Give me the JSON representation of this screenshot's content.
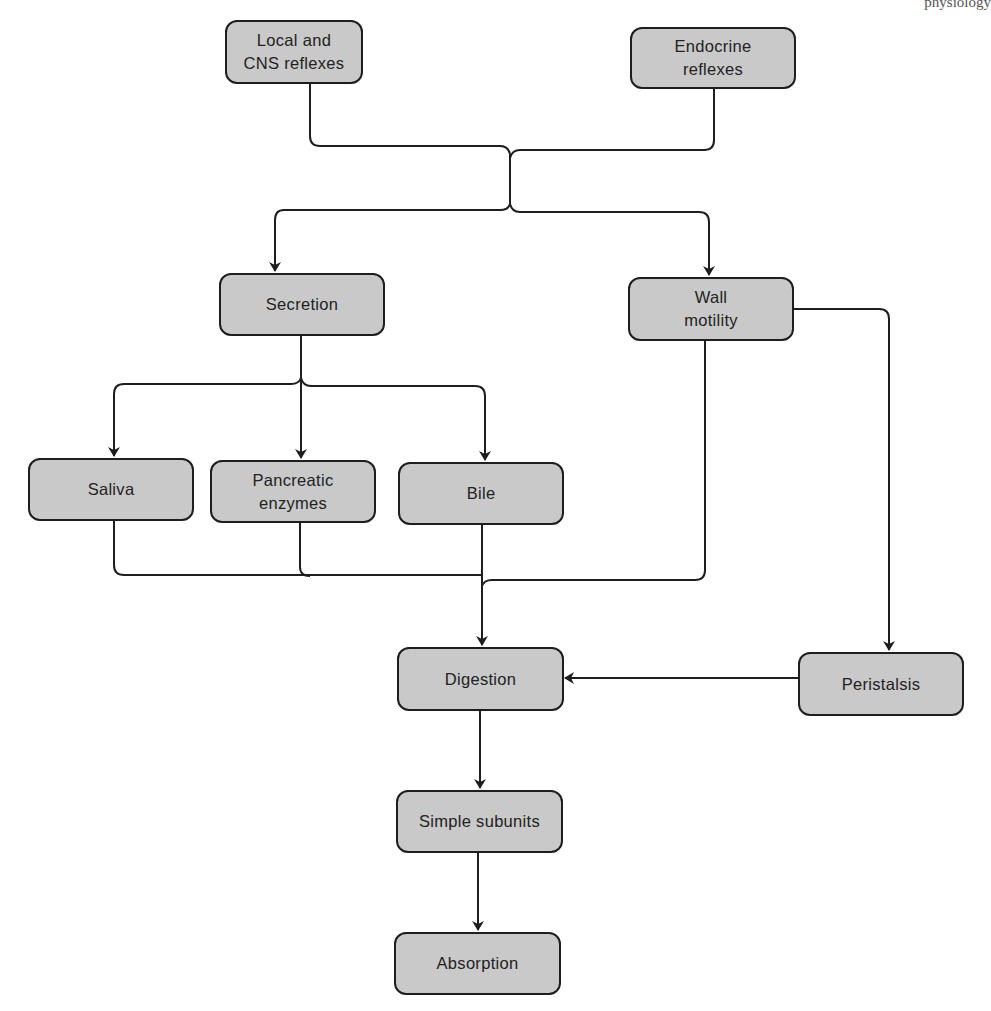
{
  "header_fragment": "physiology",
  "nodes": {
    "local": {
      "label": "Local and\nCNS reflexes"
    },
    "endocrine": {
      "label": "Endocrine\nreflexes"
    },
    "secretion": {
      "label": "Secretion"
    },
    "wall": {
      "label": "Wall\nmotility"
    },
    "saliva": {
      "label": "Saliva"
    },
    "pancreatic": {
      "label": "Pancreatic\nenzymes"
    },
    "bile": {
      "label": "Bile"
    },
    "digestion": {
      "label": "Digestion"
    },
    "peristalsis": {
      "label": "Peristalsis"
    },
    "subunits": {
      "label": "Simple subunits"
    },
    "absorption": {
      "label": "Absorption"
    }
  },
  "edges": [
    {
      "from": "Local and CNS reflexes",
      "to": "Secretion"
    },
    {
      "from": "Local and CNS reflexes",
      "to": "Wall motility"
    },
    {
      "from": "Endocrine reflexes",
      "to": "Secretion"
    },
    {
      "from": "Endocrine reflexes",
      "to": "Wall motility"
    },
    {
      "from": "Secretion",
      "to": "Saliva"
    },
    {
      "from": "Secretion",
      "to": "Pancreatic enzymes"
    },
    {
      "from": "Secretion",
      "to": "Bile"
    },
    {
      "from": "Saliva",
      "to": "Digestion"
    },
    {
      "from": "Pancreatic enzymes",
      "to": "Digestion"
    },
    {
      "from": "Bile",
      "to": "Digestion"
    },
    {
      "from": "Wall motility",
      "to": "Digestion"
    },
    {
      "from": "Wall motility",
      "to": "Peristalsis"
    },
    {
      "from": "Peristalsis",
      "to": "Digestion"
    },
    {
      "from": "Digestion",
      "to": "Simple subunits"
    },
    {
      "from": "Simple subunits",
      "to": "Absorption"
    }
  ],
  "colors": {
    "node_fill": "#c9c9c9",
    "stroke": "#1e1e1e"
  }
}
